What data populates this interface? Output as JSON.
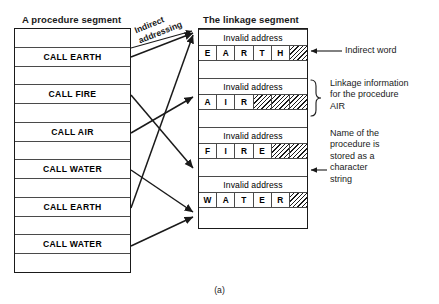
{
  "figure": {
    "caption": "(a)",
    "ink_color": "#1a1a1a"
  },
  "procedure_segment": {
    "title": "A procedure segment",
    "rows": [
      {
        "label": "",
        "kind": "blank"
      },
      {
        "label": "CALL EARTH",
        "kind": "call"
      },
      {
        "label": "",
        "kind": "blank"
      },
      {
        "label": "CALL FIRE",
        "kind": "call"
      },
      {
        "label": "",
        "kind": "blank"
      },
      {
        "label": "CALL AIR",
        "kind": "call"
      },
      {
        "label": "",
        "kind": "blank"
      },
      {
        "label": "CALL WATER",
        "kind": "call"
      },
      {
        "label": "",
        "kind": "blank"
      },
      {
        "label": "CALL EARTH",
        "kind": "call"
      },
      {
        "label": "",
        "kind": "blank"
      },
      {
        "label": "CALL WATER",
        "kind": "call"
      },
      {
        "label": "",
        "kind": "blank"
      }
    ]
  },
  "linkage_segment": {
    "title": "The linkage segment",
    "invalid_address_label": "Invalid address",
    "blocks": [
      {
        "procedure": "EARTH",
        "address_row": "Invalid address",
        "char_cells": [
          "E",
          "A",
          "R",
          "T",
          "H",
          ""
        ],
        "hatched_from_index": 5
      },
      {
        "procedure": "AIR",
        "address_row": "Invalid address",
        "char_cells": [
          "A",
          "I",
          "R",
          "",
          "",
          ""
        ],
        "hatched_from_index": 3
      },
      {
        "procedure": "FIRE",
        "address_row": "Invalid address",
        "char_cells": [
          "F",
          "I",
          "R",
          "E",
          "",
          ""
        ],
        "hatched_from_index": 4
      },
      {
        "procedure": "WATER",
        "address_row": "Invalid address",
        "char_cells": [
          "W",
          "A",
          "T",
          "E",
          "R",
          ""
        ],
        "hatched_from_index": 5
      }
    ]
  },
  "annotations": {
    "indirect_addressing": "Indirect\naddressing",
    "indirect_word": "Indirect word",
    "linkage_information": "Linkage information\nfor the procedure\nAIR",
    "name_of_procedure": "Name of the\nprocedure is\nstored as a\ncharacter\nstring"
  },
  "links": [
    {
      "from": "CALL EARTH (row 2)",
      "to": "EARTH block"
    },
    {
      "from": "CALL FIRE (row 4)",
      "to": "FIRE block"
    },
    {
      "from": "CALL AIR (row 6)",
      "to": "AIR block"
    },
    {
      "from": "CALL WATER (row 8)",
      "to": "WATER block"
    },
    {
      "from": "CALL EARTH (row 10)",
      "to": "EARTH block"
    },
    {
      "from": "CALL WATER (row 12)",
      "to": "WATER block"
    }
  ]
}
